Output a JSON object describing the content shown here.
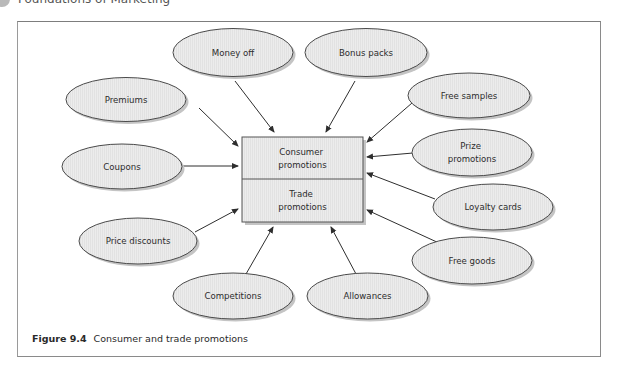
{
  "header": {
    "title": "Foundations of Marketing"
  },
  "diagram": {
    "center": {
      "top_label_lines": [
        "Consumer",
        "promotions"
      ],
      "bottom_label_lines": [
        "Trade",
        "promotions"
      ]
    },
    "nodes": [
      {
        "id": "money-off",
        "lines": [
          "Money off"
        ]
      },
      {
        "id": "bonus-packs",
        "lines": [
          "Bonus packs"
        ]
      },
      {
        "id": "premiums",
        "lines": [
          "Premiums"
        ]
      },
      {
        "id": "free-samples",
        "lines": [
          "Free samples"
        ]
      },
      {
        "id": "coupons",
        "lines": [
          "Coupons"
        ]
      },
      {
        "id": "prize-promotions",
        "lines": [
          "Prize",
          "promotions"
        ]
      },
      {
        "id": "loyalty-cards",
        "lines": [
          "Loyalty cards"
        ]
      },
      {
        "id": "price-discounts",
        "lines": [
          "Price discounts"
        ]
      },
      {
        "id": "free-goods",
        "lines": [
          "Free goods"
        ]
      },
      {
        "id": "competitions",
        "lines": [
          "Competitions"
        ]
      },
      {
        "id": "allowances",
        "lines": [
          "Allowances"
        ]
      }
    ],
    "colors": {
      "node_fill": "#e9e9e9",
      "node_stroke": "#4a4a4a",
      "shadow": "#bdbdbd",
      "arrow": "#2e2e2e"
    }
  },
  "caption": {
    "figure_label": "Figure 9.4",
    "text": "Consumer and trade promotions"
  }
}
